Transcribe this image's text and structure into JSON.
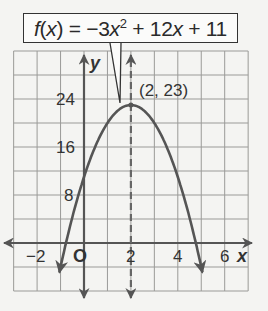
{
  "chart_data": {
    "type": "line",
    "function": "f(x) = -3x^2 + 12x + 11",
    "xlabel": "x",
    "ylabel": "y",
    "xlim": [
      -3,
      7
    ],
    "ylim": [
      -8,
      32
    ],
    "x_ticks": [
      -2,
      0,
      2,
      4,
      6
    ],
    "x_tick_labels": [
      "−2",
      "O",
      "2",
      "4",
      "6"
    ],
    "y_ticks": [
      8,
      16,
      24
    ],
    "y_tick_labels": [
      "8",
      "16",
      "24"
    ],
    "grid": true,
    "grid_x_step": 1,
    "grid_y_step": 4,
    "series": [
      {
        "name": "f(x) = -3x^2 + 12x + 11",
        "x": [
          -0.8,
          -0.5,
          0,
          0.5,
          1,
          1.5,
          2,
          2.5,
          3,
          3.5,
          4,
          4.5,
          4.8
        ],
        "values": [
          -0.52,
          4.25,
          11,
          16.25,
          20,
          22.25,
          23,
          22.25,
          20,
          16.25,
          11,
          4.25,
          -0.52
        ]
      }
    ],
    "axis_of_symmetry": {
      "x": 2,
      "style": "dashed"
    },
    "annotations": [
      {
        "text": "(2, 23)",
        "x": 2,
        "y": 23,
        "type": "vertex"
      },
      {
        "text": "f(x) = −3x² + 12x + 11",
        "type": "callout-label"
      }
    ]
  },
  "label": {
    "f": "f",
    "open": "(",
    "x1": "x",
    "close_eq": ") = −3",
    "x2": "x",
    "exp": "2",
    "mid": " + 12",
    "x3": "x",
    "tail": " + 11"
  },
  "vertex_label": "(2, 23)",
  "axis_labels": {
    "x": "x",
    "y": "y",
    "origin": "O"
  }
}
